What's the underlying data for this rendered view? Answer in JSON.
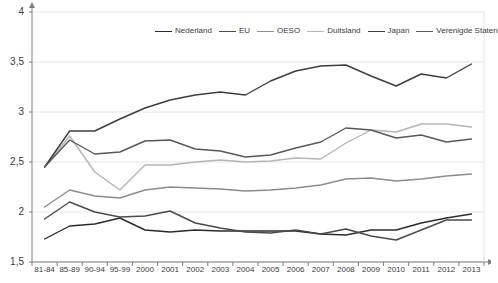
{
  "chart_data": {
    "type": "line",
    "title": "",
    "xlabel": "",
    "ylabel": "",
    "ylim": [
      1.5,
      4
    ],
    "xlim_categories": 18,
    "grid": true,
    "gridlines": [
      1.5,
      2,
      2.5,
      3,
      3.5,
      4
    ],
    "ytick_labels": [
      "4",
      "3,5",
      "3",
      "2,5",
      "2",
      "1,5"
    ],
    "ytick_values": [
      4,
      3.5,
      3,
      2.5,
      2,
      1.5
    ],
    "categories": [
      "81-84",
      "85-89",
      "90-94",
      "95-99",
      "2000",
      "2001",
      "2002",
      "2003",
      "2004",
      "2005",
      "2006",
      "2007",
      "2008",
      "2009",
      "2010",
      "2011",
      "2012",
      "2013"
    ],
    "legend_position": "top-center",
    "series": [
      {
        "name": "Nederland",
        "color": "#2b2b2b",
        "values": [
          1.73,
          1.86,
          1.88,
          1.94,
          1.82,
          1.8,
          1.82,
          1.81,
          1.81,
          1.81,
          1.81,
          1.78,
          1.77,
          1.82,
          1.82,
          1.89,
          1.94,
          1.98
        ]
      },
      {
        "name": "EU",
        "color": "#4a4a4a",
        "values": [
          1.93,
          2.1,
          2.0,
          1.95,
          1.96,
          2.01,
          1.89,
          1.84,
          1.8,
          1.79,
          1.82,
          1.78,
          1.83,
          1.76,
          1.72,
          1.82,
          1.92,
          1.92
        ]
      },
      {
        "name": "OESO",
        "color": "#8c8c8c",
        "values": [
          2.05,
          2.22,
          2.16,
          2.14,
          2.22,
          2.25,
          2.24,
          2.23,
          2.21,
          2.22,
          2.24,
          2.27,
          2.33,
          2.34,
          2.31,
          2.33,
          2.36,
          2.38
        ]
      },
      {
        "name": "Duitsland",
        "color": "#b5b5b5",
        "values": [
          2.45,
          2.76,
          2.4,
          2.22,
          2.47,
          2.47,
          2.5,
          2.52,
          2.5,
          2.51,
          2.54,
          2.53,
          2.69,
          2.82,
          2.8,
          2.88,
          2.88,
          2.85
        ]
      },
      {
        "name": "Japan",
        "color": "#3d3d3d",
        "values": [
          2.45,
          2.81,
          2.81,
          2.93,
          3.04,
          3.12,
          3.17,
          3.2,
          3.17,
          3.31,
          3.41,
          3.46,
          3.47,
          3.36,
          3.26,
          3.38,
          3.34,
          3.48
        ]
      },
      {
        "name": "Verenigde Staten",
        "color": "#585858",
        "values": [
          2.45,
          2.72,
          2.58,
          2.6,
          2.71,
          2.72,
          2.63,
          2.61,
          2.55,
          2.57,
          2.64,
          2.7,
          2.84,
          2.82,
          2.74,
          2.77,
          2.7,
          2.73
        ]
      }
    ]
  },
  "legend": {
    "items": [
      {
        "label": "Nederland"
      },
      {
        "label": "EU"
      },
      {
        "label": "OESO"
      },
      {
        "label": "Duitsland"
      },
      {
        "label": "Japan"
      },
      {
        "label": "Verenigde Staten"
      }
    ]
  },
  "axes": {
    "x_labels": [
      "81-84",
      "85-89",
      "90-94",
      "95-99",
      "2000",
      "2001",
      "2002",
      "2003",
      "2004",
      "2005",
      "2006",
      "2007",
      "2008",
      "2009",
      "2010",
      "2011",
      "2012",
      "2013"
    ],
    "y_labels": [
      "4",
      "3,5",
      "3",
      "2,5",
      "2",
      "1,5"
    ]
  },
  "colors": {
    "grid": "#e6e6e6",
    "axis": "#808080",
    "text": "#3a3a3a",
    "background": "#ffffff"
  }
}
